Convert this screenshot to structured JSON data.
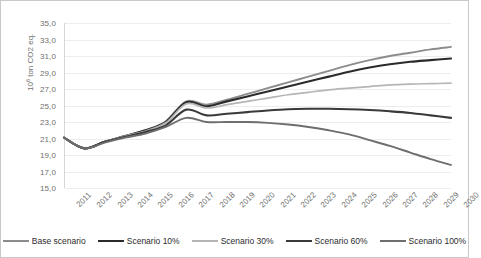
{
  "chart_data": {
    "type": "line",
    "title": "",
    "xlabel": "",
    "ylabel": "10⁶ ton CO2 eq.",
    "ylabel_base": "10",
    "ylabel_exp": "6",
    "ylabel_rest": " ton CO2 eq.",
    "x": [
      2011,
      2012,
      2013,
      2014,
      2015,
      2016,
      2017,
      2018,
      2019,
      2020,
      2021,
      2022,
      2023,
      2024,
      2025,
      2026,
      2027,
      2028,
      2029,
      2030
    ],
    "categories": [
      "2011",
      "2012",
      "2013",
      "2014",
      "2015",
      "2016",
      "2017",
      "2018",
      "2019",
      "2020",
      "2021",
      "2022",
      "2023",
      "2024",
      "2025",
      "2026",
      "2027",
      "2028",
      "2029",
      "2030"
    ],
    "ylim": [
      15.0,
      35.0
    ],
    "ytick_step": 2.0,
    "ytick_labels": [
      "35,0",
      "33,0",
      "31,0",
      "29,0",
      "27,0",
      "25,0",
      "23,0",
      "21,0",
      "19,0",
      "17,0",
      "15,0"
    ],
    "ytick_values": [
      35.0,
      33.0,
      31.0,
      29.0,
      27.0,
      25.0,
      23.0,
      21.0,
      19.0,
      17.0,
      15.0
    ],
    "grid": true,
    "legend_position": "bottom",
    "decimal_separator": ",",
    "series": [
      {
        "name": "Base scenario",
        "color": "#8c8c8c",
        "width": 1.9,
        "values": [
          21.1,
          19.8,
          20.6,
          21.3,
          22.0,
          23.1,
          25.5,
          25.1,
          25.7,
          26.4,
          27.1,
          27.8,
          28.5,
          29.2,
          29.9,
          30.5,
          31.0,
          31.4,
          31.8,
          32.1
        ]
      },
      {
        "name": "Scenario 10%",
        "color": "#2b2b2b",
        "width": 2.1,
        "values": [
          21.1,
          19.8,
          20.6,
          21.3,
          22.0,
          23.0,
          25.4,
          24.9,
          25.5,
          26.1,
          26.7,
          27.3,
          27.9,
          28.5,
          29.1,
          29.6,
          30.0,
          30.3,
          30.5,
          30.7
        ]
      },
      {
        "name": "Scenario 30%",
        "color": "#b5b5b5",
        "width": 1.7,
        "values": [
          21.1,
          19.8,
          20.6,
          21.3,
          21.9,
          22.9,
          25.2,
          24.7,
          25.1,
          25.5,
          25.9,
          26.3,
          26.6,
          26.9,
          27.1,
          27.3,
          27.5,
          27.6,
          27.65,
          27.7
        ]
      },
      {
        "name": "Scenario 60%",
        "color": "#3a3a3a",
        "width": 2.1,
        "values": [
          21.1,
          19.8,
          20.6,
          21.2,
          21.8,
          22.6,
          24.5,
          23.8,
          24.0,
          24.2,
          24.4,
          24.55,
          24.6,
          24.6,
          24.55,
          24.45,
          24.3,
          24.1,
          23.8,
          23.5
        ]
      },
      {
        "name": "Scenario 100%",
        "color": "#6e6e6e",
        "width": 1.9,
        "values": [
          21.1,
          19.8,
          20.5,
          21.1,
          21.6,
          22.4,
          23.5,
          23.0,
          23.0,
          23.0,
          22.9,
          22.7,
          22.4,
          22.0,
          21.5,
          20.8,
          20.1,
          19.3,
          18.5,
          17.8
        ]
      }
    ]
  },
  "legend": {
    "items": [
      {
        "label": "Base scenario"
      },
      {
        "label": "Scenario 10%"
      },
      {
        "label": "Scenario 30%"
      },
      {
        "label": "Scenario 60%"
      },
      {
        "label": "Scenario 100%"
      }
    ]
  }
}
